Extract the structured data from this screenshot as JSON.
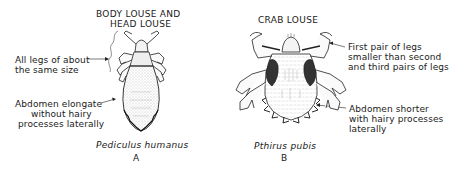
{
  "figure": {
    "panel_a": {
      "title_line1": "BODY LOUSE AND",
      "title_line2": "HEAD LOUSE",
      "annotation_legs_line1": "All legs of about",
      "annotation_legs_line2": "the same size",
      "annotation_abdomen_line1": "Abdomen elongate",
      "annotation_abdomen_line2": "without hairy",
      "annotation_abdomen_line3": "processes laterally",
      "species": "Pediculus humanus",
      "letter": "A"
    },
    "panel_b": {
      "title": "CRAB LOUSE",
      "annotation_legs_line1": "First pair of legs",
      "annotation_legs_line2": "smaller than second",
      "annotation_legs_line3": "and third pairs of legs",
      "annotation_abdomen_line1": "Abdomen shorter",
      "annotation_abdomen_line2": "with hairy processes",
      "annotation_abdomen_line3": "laterally",
      "species": "Pthirus pubis",
      "letter": "B"
    }
  }
}
